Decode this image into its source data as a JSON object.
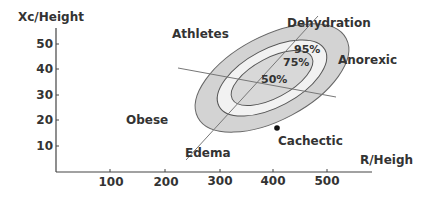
{
  "diagram": {
    "type": "biva-tolerance-ellipses",
    "x_axis": {
      "label": "R/Heigh",
      "ticks": [
        100,
        200,
        300,
        400,
        500
      ]
    },
    "y_axis": {
      "label": "Xc/Height",
      "ticks": [
        10,
        20,
        30,
        40,
        50
      ]
    },
    "ellipses": [
      {
        "label": "95%",
        "fill": "#d3d3d3"
      },
      {
        "label": "75%",
        "fill": "#f2f2f2"
      },
      {
        "label": "50%",
        "fill": "#d8d8d8"
      }
    ],
    "region_labels": {
      "athletes": "Athletes",
      "dehydration": "Dehydration",
      "anorexic": "Anorexic",
      "obese": "Obese",
      "edema": "Edema",
      "cachectic": "Cachectic"
    },
    "point": {
      "label": "Cachectic"
    },
    "colors": {
      "text": "#333333",
      "axis": "#444444",
      "ellipse_stroke": "#555555"
    }
  }
}
